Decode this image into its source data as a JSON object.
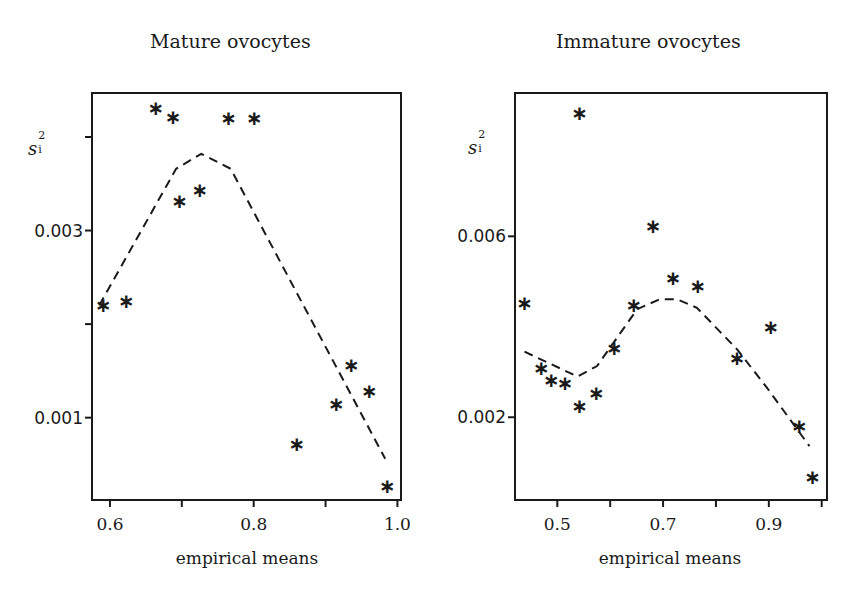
{
  "chart_data": [
    {
      "type": "scatter",
      "title": "Mature ovocytes",
      "xlabel": "empirical means",
      "ylabel": "s_i^2",
      "xlim": [
        0.575,
        1.005
      ],
      "ylim": [
        0.00012,
        0.00447
      ],
      "xticks": [
        0.6,
        0.7,
        0.8,
        0.9,
        1.0
      ],
      "xtick_labels": [
        "0.6",
        "",
        "0.8",
        "",
        "1.0"
      ],
      "yticks": [
        0.001,
        0.002,
        0.003,
        0.004
      ],
      "ytick_labels": [
        "0.001",
        "",
        "0.003",
        ""
      ],
      "grid": false,
      "series": [
        {
          "name": "empirical variances",
          "marker": "asterisk",
          "x": [
            0.591,
            0.623,
            0.664,
            0.688,
            0.697,
            0.725,
            0.765,
            0.801,
            0.86,
            0.915,
            0.936,
            0.961,
            0.986
          ],
          "y": [
            0.00223,
            0.00227,
            0.00433,
            0.00423,
            0.00334,
            0.00345,
            0.00422,
            0.00422,
            0.00074,
            0.00117,
            0.00158,
            0.00131,
            0.00029
          ]
        },
        {
          "name": "fitted variance function",
          "style": "dashed",
          "x": [
            0.585,
            0.692,
            0.727,
            0.768,
            0.983
          ],
          "y": [
            0.0022,
            0.00366,
            0.00382,
            0.00366,
            0.00056
          ]
        }
      ]
    },
    {
      "type": "scatter",
      "title": "Immature ovocytes",
      "xlabel": "empirical means",
      "ylabel": "s_i^2",
      "xlim": [
        0.42,
        1.01
      ],
      "ylim": [
        0.00017,
        0.00917
      ],
      "xticks": [
        0.5,
        0.6,
        0.7,
        0.8,
        0.9,
        1.0
      ],
      "xtick_labels": [
        "0.5",
        "",
        "0.7",
        "",
        "0.9",
        ""
      ],
      "yticks": [
        0.002,
        0.006
      ],
      "ytick_labels": [
        "0.002",
        "0.006"
      ],
      "grid": false,
      "series": [
        {
          "name": "empirical variances",
          "marker": "asterisk",
          "x": [
            0.438,
            0.47,
            0.489,
            0.515,
            0.542,
            0.574,
            0.608,
            0.645,
            0.542,
            0.681,
            0.719,
            0.766,
            0.84,
            0.904,
            0.958,
            0.983
          ],
          "y": [
            0.00457,
            0.00313,
            0.00286,
            0.00281,
            0.0023,
            0.00258,
            0.00358,
            0.00452,
            0.00878,
            0.00628,
            0.00512,
            0.00495,
            0.00335,
            0.00403,
            0.00185,
            0.00072
          ]
        },
        {
          "name": "fitted variance function",
          "style": "dashed",
          "x": [
            0.438,
            0.538,
            0.575,
            0.651,
            0.694,
            0.726,
            0.764,
            0.84,
            0.896,
            0.977
          ],
          "y": [
            0.00345,
            0.0029,
            0.00313,
            0.00439,
            0.00461,
            0.00461,
            0.00442,
            0.0035,
            0.00266,
            0.00136
          ]
        }
      ]
    }
  ],
  "panels": {
    "left": {
      "title": "Mature ovocytes",
      "xlabel": "empirical means",
      "ylabel_base": "s",
      "ylabel_sub": "i",
      "ylabel_sup": "2"
    },
    "right": {
      "title": "Immature ovocytes",
      "xlabel": "empirical means",
      "ylabel_base": "s",
      "ylabel_sub": "i",
      "ylabel_sup": "2"
    }
  },
  "colors": {
    "ink": "#1a1a1a",
    "background": "#ffffff"
  },
  "layout": [
    {
      "box": [
        92,
        93,
        401,
        500
      ]
    },
    {
      "box": [
        515,
        93,
        827,
        500
      ]
    }
  ]
}
